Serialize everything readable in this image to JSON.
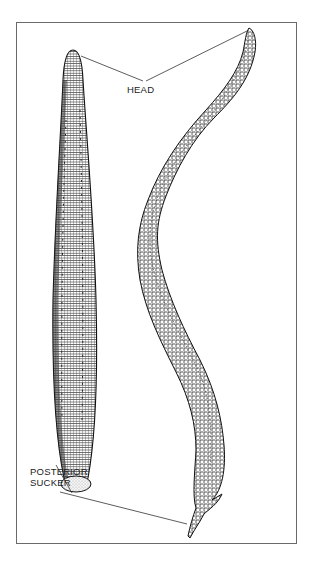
{
  "figure": {
    "labels": {
      "head": "HEAD",
      "posterior_sucker_line1": "POSTERIOR",
      "posterior_sucker_line2": "SUCKER"
    },
    "specimens": [
      {
        "name": "contracted-leech",
        "position": "left"
      },
      {
        "name": "extended-leech",
        "position": "right"
      }
    ],
    "colors": {
      "ink": "#222222",
      "frame": "#6a6a6a",
      "background": "#ffffff"
    }
  }
}
